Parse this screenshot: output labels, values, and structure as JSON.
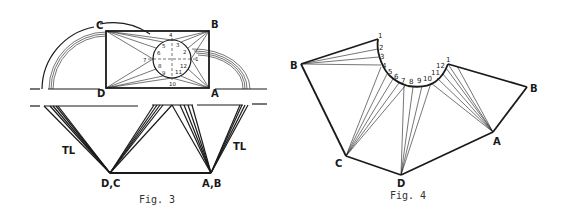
{
  "fig3": {
    "caption": "Fig. 3",
    "labels": {
      "C": "C",
      "B": "B",
      "D": "D",
      "A": "A",
      "tl_left": "TL",
      "tl_right": "TL",
      "dc": "D,C",
      "ab": "A,B"
    },
    "circle_numbers": [
      "1",
      "2",
      "3",
      "4",
      "5",
      "6",
      "7",
      "8",
      "9",
      "10",
      "11",
      "12"
    ]
  },
  "fig4": {
    "caption": "Fig. 4",
    "labels": {
      "B_left": "B",
      "B_right": "B",
      "C": "C",
      "D": "D",
      "A": "A"
    },
    "arc_numbers": [
      "1",
      "2",
      "3",
      "4",
      "5",
      "6",
      "7",
      "8",
      "9",
      "10",
      "11",
      "12",
      "1"
    ]
  },
  "colors": {
    "ink": "#1a1a1a",
    "background": "#ffffff"
  }
}
